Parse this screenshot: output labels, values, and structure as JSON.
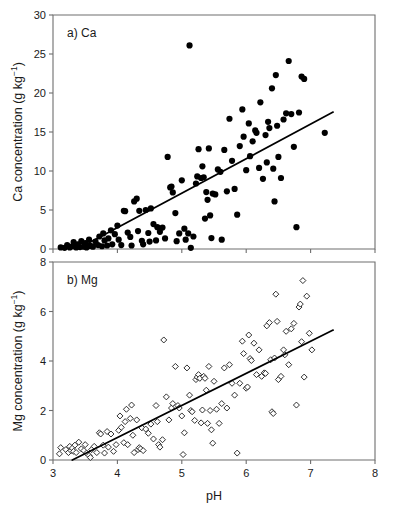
{
  "figure": {
    "xlabel": "pH",
    "yunit_main": "concentration (g kg",
    "yunit_sup": "−1",
    "yunit_close": ")"
  },
  "chart_data": [
    {
      "type": "scatter",
      "panel_label": "a) Ca",
      "title": "",
      "xlabel": "",
      "ylabel": "Ca concentration (g kg−1)",
      "xlim": [
        3,
        8
      ],
      "ylim": [
        0,
        30
      ],
      "xticks": [
        3,
        4,
        5,
        6,
        7,
        8
      ],
      "yticks": [
        0,
        5,
        10,
        15,
        20,
        25,
        30
      ],
      "xtick_labels": [
        "",
        "",
        "",
        "",
        "",
        ""
      ],
      "ytick_labels": [
        "0",
        "5",
        "10",
        "15",
        "20",
        "25",
        "30"
      ],
      "grid": false,
      "legend": null,
      "marker": "filled-circle",
      "marker_size": 3.1,
      "trendline": {
        "x": [
          3.38,
          7.35
        ],
        "y": [
          0.0,
          17.55
        ],
        "slope": 4.42,
        "intercept": -14.94
      },
      "points": [
        [
          3.12,
          0.2
        ],
        [
          3.18,
          0.15
        ],
        [
          3.22,
          0.5
        ],
        [
          3.26,
          0.2
        ],
        [
          3.3,
          0.35
        ],
        [
          3.32,
          0.9
        ],
        [
          3.36,
          0.2
        ],
        [
          3.38,
          0.6
        ],
        [
          3.42,
          0.25
        ],
        [
          3.44,
          1.0
        ],
        [
          3.48,
          0.3
        ],
        [
          3.5,
          0.75
        ],
        [
          3.52,
          0.2
        ],
        [
          3.56,
          1.2
        ],
        [
          3.58,
          0.4
        ],
        [
          3.62,
          0.3
        ],
        [
          3.66,
          0.95
        ],
        [
          3.7,
          0.5
        ],
        [
          3.72,
          1.6
        ],
        [
          3.76,
          0.35
        ],
        [
          3.78,
          2.0
        ],
        [
          3.8,
          1.1
        ],
        [
          3.84,
          0.45
        ],
        [
          3.86,
          1.35
        ],
        [
          3.9,
          2.4
        ],
        [
          3.92,
          0.6
        ],
        [
          3.96,
          1.9
        ],
        [
          4.0,
          3.0
        ],
        [
          4.02,
          1.2
        ],
        [
          4.06,
          0.5
        ],
        [
          4.1,
          4.9
        ],
        [
          4.12,
          4.85
        ],
        [
          4.16,
          2.1
        ],
        [
          4.2,
          1.55
        ],
        [
          4.22,
          0.45
        ],
        [
          4.26,
          6.1
        ],
        [
          4.3,
          6.45
        ],
        [
          4.32,
          2.3
        ],
        [
          4.34,
          4.9
        ],
        [
          4.38,
          1.05
        ],
        [
          4.4,
          0.6
        ],
        [
          4.44,
          5.0
        ],
        [
          4.48,
          2.05
        ],
        [
          4.5,
          0.95
        ],
        [
          4.52,
          5.2
        ],
        [
          4.56,
          3.2
        ],
        [
          4.6,
          1.1
        ],
        [
          4.62,
          2.8
        ],
        [
          4.66,
          2.2
        ],
        [
          4.7,
          2.75
        ],
        [
          4.74,
          1.35
        ],
        [
          4.78,
          11.8
        ],
        [
          4.82,
          7.9
        ],
        [
          4.84,
          8.0
        ],
        [
          4.86,
          7.25
        ],
        [
          4.9,
          4.6
        ],
        [
          4.92,
          1.0
        ],
        [
          4.96,
          2.0
        ],
        [
          5.0,
          8.8
        ],
        [
          5.04,
          2.6
        ],
        [
          5.06,
          1.2
        ],
        [
          5.1,
          2.0
        ],
        [
          5.12,
          26.1
        ],
        [
          5.14,
          0.15
        ],
        [
          5.18,
          1.6
        ],
        [
          5.22,
          8.4
        ],
        [
          5.24,
          9.3
        ],
        [
          5.26,
          12.8
        ],
        [
          5.3,
          9.1
        ],
        [
          5.32,
          10.6
        ],
        [
          5.34,
          9.2
        ],
        [
          5.36,
          3.9
        ],
        [
          5.38,
          7.3
        ],
        [
          5.4,
          6.3
        ],
        [
          5.42,
          12.9
        ],
        [
          5.44,
          4.3
        ],
        [
          5.46,
          1.4
        ],
        [
          5.48,
          7.1
        ],
        [
          5.52,
          7.0
        ],
        [
          5.56,
          10.2
        ],
        [
          5.6,
          9.9
        ],
        [
          5.62,
          1.2
        ],
        [
          5.66,
          12.7
        ],
        [
          5.7,
          7.4
        ],
        [
          5.74,
          16.7
        ],
        [
          5.78,
          11.3
        ],
        [
          5.82,
          7.7
        ],
        [
          5.86,
          4.4
        ],
        [
          5.9,
          13.2
        ],
        [
          5.94,
          17.9
        ],
        [
          5.96,
          14.4
        ],
        [
          6.0,
          10.1
        ],
        [
          6.04,
          16.1
        ],
        [
          6.06,
          11.9
        ],
        [
          6.1,
          13.8
        ],
        [
          6.14,
          15.2
        ],
        [
          6.16,
          14.9
        ],
        [
          6.2,
          10.4
        ],
        [
          6.22,
          18.8
        ],
        [
          6.26,
          9.0
        ],
        [
          6.3,
          14.6
        ],
        [
          6.32,
          11.1
        ],
        [
          6.34,
          16.3
        ],
        [
          6.36,
          15.5
        ],
        [
          6.4,
          20.6
        ],
        [
          6.42,
          10.3
        ],
        [
          6.44,
          6.1
        ],
        [
          6.46,
          22.3
        ],
        [
          6.48,
          15.8
        ],
        [
          6.5,
          11.8
        ],
        [
          6.54,
          9.1
        ],
        [
          6.58,
          16.6
        ],
        [
          6.62,
          17.4
        ],
        [
          6.66,
          24.1
        ],
        [
          6.7,
          17.3
        ],
        [
          6.74,
          13.1
        ],
        [
          6.78,
          2.8
        ],
        [
          6.82,
          17.5
        ],
        [
          6.86,
          22.1
        ],
        [
          6.9,
          21.8
        ],
        [
          7.22,
          14.9
        ]
      ]
    },
    {
      "type": "scatter",
      "panel_label": "b) Mg",
      "title": "",
      "xlabel": "pH",
      "ylabel": "Mg concentration (g kg−1)",
      "xlim": [
        3,
        8
      ],
      "ylim": [
        0,
        8
      ],
      "xticks": [
        3,
        4,
        5,
        6,
        7,
        8
      ],
      "yticks": [
        0,
        2,
        4,
        6,
        8
      ],
      "xtick_labels": [
        "3",
        "4",
        "5",
        "6",
        "7",
        "8"
      ],
      "ytick_labels": [
        "0",
        "2",
        "4",
        "6",
        "8"
      ],
      "grid": false,
      "legend": null,
      "marker": "open-diamond",
      "marker_size": 3.0,
      "trendline": {
        "x": [
          3.3,
          7.35
        ],
        "y": [
          0.0,
          5.25
        ],
        "slope": 1.296,
        "intercept": -4.277
      },
      "points": [
        [
          3.1,
          0.25
        ],
        [
          3.12,
          0.5
        ],
        [
          3.2,
          0.42
        ],
        [
          3.24,
          0.3
        ],
        [
          3.26,
          0.55
        ],
        [
          3.28,
          0.38
        ],
        [
          3.3,
          0.48
        ],
        [
          3.32,
          0.35
        ],
        [
          3.34,
          0.6
        ],
        [
          3.36,
          0.3
        ],
        [
          3.4,
          0.72
        ],
        [
          3.44,
          0.45
        ],
        [
          3.48,
          0.38
        ],
        [
          3.5,
          0.62
        ],
        [
          3.52,
          0.28
        ],
        [
          3.56,
          0.18
        ],
        [
          3.58,
          0.1
        ],
        [
          3.6,
          0.42
        ],
        [
          3.64,
          0.55
        ],
        [
          3.68,
          0.3
        ],
        [
          3.72,
          1.1
        ],
        [
          3.74,
          1.05
        ],
        [
          3.78,
          0.6
        ],
        [
          3.8,
          0.28
        ],
        [
          3.84,
          1.15
        ],
        [
          3.86,
          0.52
        ],
        [
          3.9,
          1.05
        ],
        [
          3.94,
          0.35
        ],
        [
          3.98,
          0.62
        ],
        [
          4.02,
          1.2
        ],
        [
          4.04,
          1.78
        ],
        [
          4.06,
          1.32
        ],
        [
          4.1,
          0.7
        ],
        [
          4.12,
          1.55
        ],
        [
          4.14,
          2.05
        ],
        [
          4.16,
          0.62
        ],
        [
          4.2,
          1.68
        ],
        [
          4.22,
          2.22
        ],
        [
          4.24,
          1.0
        ],
        [
          4.26,
          0.3
        ],
        [
          4.3,
          1.62
        ],
        [
          4.32,
          0.42
        ],
        [
          4.34,
          0.5
        ],
        [
          4.36,
          0.45
        ],
        [
          4.38,
          1.3
        ],
        [
          4.4,
          0.38
        ],
        [
          4.44,
          1.25
        ],
        [
          4.48,
          1.08
        ],
        [
          4.52,
          1.45
        ],
        [
          4.56,
          0.85
        ],
        [
          4.6,
          2.2
        ],
        [
          4.62,
          1.55
        ],
        [
          4.64,
          0.62
        ],
        [
          4.66,
          0.52
        ],
        [
          4.7,
          0.82
        ],
        [
          4.72,
          4.85
        ],
        [
          4.76,
          2.55
        ],
        [
          4.8,
          1.62
        ],
        [
          4.84,
          2.1
        ],
        [
          4.86,
          2.28
        ],
        [
          4.9,
          3.78
        ],
        [
          4.94,
          2.2
        ],
        [
          4.96,
          2.1
        ],
        [
          5.0,
          1.78
        ],
        [
          5.02,
          0.22
        ],
        [
          5.04,
          1.1
        ],
        [
          5.08,
          3.72
        ],
        [
          5.12,
          2.62
        ],
        [
          5.14,
          2.0
        ],
        [
          5.16,
          1.95
        ],
        [
          5.2,
          1.6
        ],
        [
          5.22,
          3.25
        ],
        [
          5.24,
          3.35
        ],
        [
          5.26,
          3.45
        ],
        [
          5.28,
          3.3
        ],
        [
          5.3,
          1.5
        ],
        [
          5.32,
          2.02
        ],
        [
          5.34,
          3.38
        ],
        [
          5.36,
          3.3
        ],
        [
          5.38,
          2.82
        ],
        [
          5.4,
          1.48
        ],
        [
          5.42,
          3.78
        ],
        [
          5.44,
          2.0
        ],
        [
          5.46,
          1.22
        ],
        [
          5.48,
          0.68
        ],
        [
          5.5,
          3.18
        ],
        [
          5.54,
          2.05
        ],
        [
          5.58,
          1.48
        ],
        [
          5.62,
          2.28
        ],
        [
          5.66,
          3.72
        ],
        [
          5.7,
          2.1
        ],
        [
          5.74,
          3.85
        ],
        [
          5.78,
          3.1
        ],
        [
          5.82,
          2.62
        ],
        [
          5.86,
          0.28
        ],
        [
          5.9,
          3.1
        ],
        [
          5.94,
          4.8
        ],
        [
          5.96,
          4.3
        ],
        [
          6.0,
          2.9
        ],
        [
          6.02,
          2.95
        ],
        [
          6.04,
          5.05
        ],
        [
          6.06,
          4.1
        ],
        [
          6.08,
          4.02
        ],
        [
          6.12,
          4.72
        ],
        [
          6.16,
          3.45
        ],
        [
          6.2,
          4.45
        ],
        [
          6.24,
          3.38
        ],
        [
          6.28,
          3.52
        ],
        [
          6.3,
          3.5
        ],
        [
          6.32,
          5.42
        ],
        [
          6.36,
          5.55
        ],
        [
          6.38,
          4.05
        ],
        [
          6.4,
          1.95
        ],
        [
          6.42,
          1.88
        ],
        [
          6.44,
          4.12
        ],
        [
          6.46,
          6.7
        ],
        [
          6.48,
          5.6
        ],
        [
          6.5,
          3.25
        ],
        [
          6.54,
          3.38
        ],
        [
          6.58,
          4.45
        ],
        [
          6.6,
          4.25
        ],
        [
          6.62,
          5.2
        ],
        [
          6.66,
          3.85
        ],
        [
          6.7,
          5.3
        ],
        [
          6.74,
          5.52
        ],
        [
          6.78,
          2.22
        ],
        [
          6.82,
          6.18
        ],
        [
          6.84,
          6.3
        ],
        [
          6.86,
          4.78
        ],
        [
          6.88,
          7.25
        ],
        [
          6.9,
          3.35
        ],
        [
          6.94,
          6.62
        ],
        [
          6.98,
          5.12
        ],
        [
          7.02,
          4.45
        ]
      ]
    }
  ]
}
